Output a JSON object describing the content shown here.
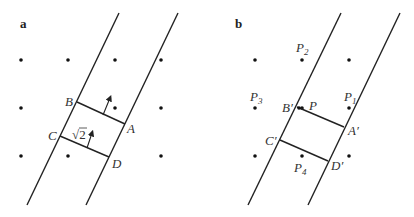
{
  "panels": [
    {
      "id": "a",
      "label": "a",
      "label_pos": [
        20,
        28
      ],
      "dots": [
        [
          21,
          60
        ],
        [
          68,
          60
        ],
        [
          115,
          60
        ],
        [
          161,
          60
        ],
        [
          21,
          108
        ],
        [
          115,
          108
        ],
        [
          161,
          108
        ],
        [
          21,
          156
        ],
        [
          68,
          156
        ],
        [
          161,
          156
        ]
      ],
      "lines": [
        {
          "name": "left-boundary-line",
          "x1": 119,
          "y1": 13,
          "x2": 27,
          "y2": 205
        },
        {
          "name": "right-boundary-line",
          "x1": 178,
          "y1": 13,
          "x2": 86,
          "y2": 205
        },
        {
          "name": "segment-BA",
          "x1": 77,
          "y1": 102,
          "x2": 125,
          "y2": 124
        },
        {
          "name": "segment-CD",
          "x1": 60,
          "y1": 136,
          "x2": 109,
          "y2": 157
        }
      ],
      "arrows": [
        {
          "name": "normal-arrow-BA",
          "x1": 103,
          "y1": 115,
          "x2": 110,
          "y2": 98
        },
        {
          "name": "normal-arrow-CD",
          "x1": 87,
          "y1": 148,
          "x2": 92,
          "y2": 133
        }
      ],
      "points": [
        {
          "name": "B",
          "text": "B",
          "x": 65,
          "y": 106
        },
        {
          "name": "A",
          "text": "A",
          "x": 127,
          "y": 133
        },
        {
          "name": "C",
          "text": "C",
          "x": 48,
          "y": 140
        },
        {
          "name": "D",
          "text": "D",
          "x": 112,
          "y": 168
        }
      ],
      "annotation": {
        "text": "√2",
        "x": 72,
        "y": 139
      }
    },
    {
      "id": "b",
      "label": "b",
      "label_pos": [
        235,
        28
      ],
      "dots": [
        [
          255,
          60
        ],
        [
          302,
          60
        ],
        [
          349,
          60
        ],
        [
          255,
          108
        ],
        [
          302,
          108
        ],
        [
          349,
          108
        ],
        [
          255,
          156
        ],
        [
          302,
          156
        ],
        [
          349,
          156
        ]
      ],
      "lines": [
        {
          "name": "left-boundary-line",
          "x1": 341,
          "y1": 13,
          "x2": 248,
          "y2": 205
        },
        {
          "name": "right-boundary-line",
          "x1": 400,
          "y1": 13,
          "x2": 308,
          "y2": 205
        },
        {
          "name": "segment-B'A'",
          "x1": 297,
          "y1": 107,
          "x2": 344,
          "y2": 127
        },
        {
          "name": "segment-C'D'",
          "x1": 280,
          "y1": 140,
          "x2": 328,
          "y2": 161
        }
      ],
      "points": [
        {
          "name": "P2",
          "text": "P",
          "sub": "2",
          "x": 296,
          "y": 52
        },
        {
          "name": "P3",
          "text": "P",
          "sub": "3",
          "x": 250,
          "y": 101
        },
        {
          "name": "B'",
          "text": "B′",
          "x": 282,
          "y": 112
        },
        {
          "name": "P",
          "text": "P",
          "x": 309,
          "y": 110
        },
        {
          "name": "P1",
          "text": "P",
          "sub": "1",
          "x": 344,
          "y": 101
        },
        {
          "name": "A'",
          "text": "A′",
          "x": 348,
          "y": 135
        },
        {
          "name": "C'",
          "text": "C′",
          "x": 265,
          "y": 145
        },
        {
          "name": "P4",
          "text": "P",
          "sub": "4",
          "x": 294,
          "y": 172
        },
        {
          "name": "D'",
          "text": "D′",
          "x": 331,
          "y": 170
        }
      ]
    }
  ],
  "colors": {
    "stroke": "#222222",
    "dot": "#111111",
    "text": "#333333"
  }
}
